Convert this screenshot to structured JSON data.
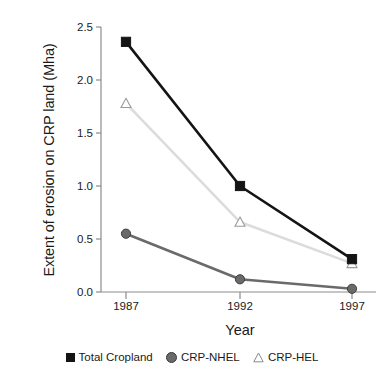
{
  "chart_data": {
    "type": "line",
    "title": "",
    "xlabel": "Year",
    "ylabel": "Extent of erosion on CRP land (Mha)",
    "categories": [
      "1987",
      "1992",
      "1997"
    ],
    "x": [
      1987,
      1992,
      1997
    ],
    "xlim": [
      1985.5,
      1998.5
    ],
    "ylim": [
      0.0,
      2.5
    ],
    "yticks": [
      "0.0",
      "0.5",
      "1.0",
      "1.5",
      "2.0",
      "2.5"
    ],
    "ytick_values": [
      0.0,
      0.5,
      1.0,
      1.5,
      2.0,
      2.5
    ],
    "xticks": [
      "1987",
      "1992",
      "1997"
    ],
    "grid": false,
    "legend_position": "bottom",
    "series": [
      {
        "name": "Total Cropland",
        "marker": "square",
        "color": "#141414",
        "line_color": "#141414",
        "values": [
          2.36,
          1.0,
          0.31
        ]
      },
      {
        "name": "CRP-NHEL",
        "marker": "circle",
        "color": "#6a6a6a",
        "line_color": "#6a6a6a",
        "values": [
          0.55,
          0.12,
          0.03
        ]
      },
      {
        "name": "CRP-HEL",
        "marker": "triangle",
        "color": "#ffffff",
        "line_color": "#dcdcdc",
        "values": [
          1.78,
          0.66,
          0.27
        ]
      }
    ]
  },
  "axis": {
    "y_label": "Extent of erosion on CRP land (Mha)",
    "x_label": "Year",
    "axis_color": "#8c8c8c"
  },
  "legend": {
    "items": [
      {
        "label": "Total Cropland",
        "marker": "square-marker-icon"
      },
      {
        "label": "CRP-NHEL",
        "marker": "circle-marker-icon"
      },
      {
        "label": "CRP-HEL",
        "marker": "triangle-marker-icon"
      }
    ]
  }
}
